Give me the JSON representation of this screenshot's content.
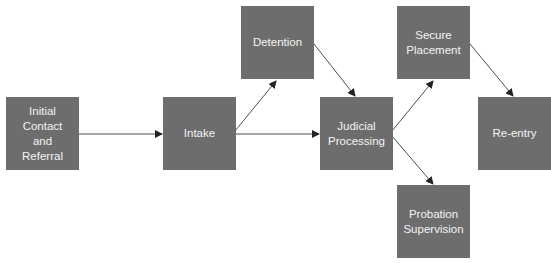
{
  "diagram": {
    "type": "flowchart",
    "colors": {
      "node_fill": "#6d6d6d",
      "node_text": "#f4f4f4",
      "edge": "#222222",
      "background": "#ffffff"
    },
    "nodes": [
      {
        "id": "initial",
        "label": "Initial\nContact\nand\nReferral",
        "x": 6,
        "y": 97
      },
      {
        "id": "intake",
        "label": "Intake",
        "x": 163,
        "y": 97
      },
      {
        "id": "detention",
        "label": "Detention",
        "x": 241,
        "y": 6
      },
      {
        "id": "judicial",
        "label": "Judicial\nProcessing",
        "x": 320,
        "y": 97
      },
      {
        "id": "secure",
        "label": "Secure\nPlacement",
        "x": 397,
        "y": 6
      },
      {
        "id": "probation",
        "label": "Probation\nSupervision",
        "x": 397,
        "y": 185
      },
      {
        "id": "reentry",
        "label": "Re-entry",
        "x": 478,
        "y": 97
      }
    ],
    "edges": [
      {
        "from": "initial",
        "to": "intake"
      },
      {
        "from": "intake",
        "to": "detention"
      },
      {
        "from": "intake",
        "to": "judicial"
      },
      {
        "from": "detention",
        "to": "judicial"
      },
      {
        "from": "judicial",
        "to": "secure"
      },
      {
        "from": "judicial",
        "to": "probation"
      },
      {
        "from": "secure",
        "to": "reentry"
      }
    ]
  }
}
